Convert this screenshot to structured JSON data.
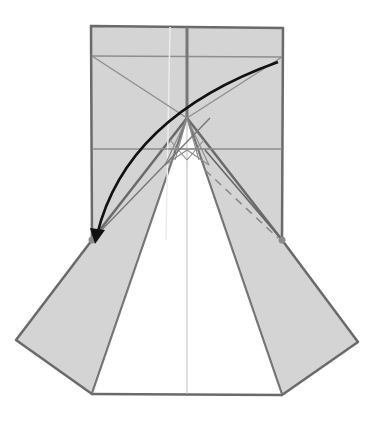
{
  "diagram": {
    "kind": "origami-diagram",
    "colors": {
      "paper": "#d4d4d4",
      "paper_white": "#ffffff",
      "edge": "#6a6a6a",
      "crease": "#8e8e8e",
      "light_crease": "#e8e8e8",
      "arrow": "#111111",
      "point_marker": "#8a8a8a"
    },
    "elements": {
      "folding_arrow": "Arrow from top-right corner curving to left reference point",
      "valley_fold": "Dashed valley fold line on right flap",
      "reference_points": [
        "left-reference-point",
        "right-reference-point"
      ]
    }
  }
}
